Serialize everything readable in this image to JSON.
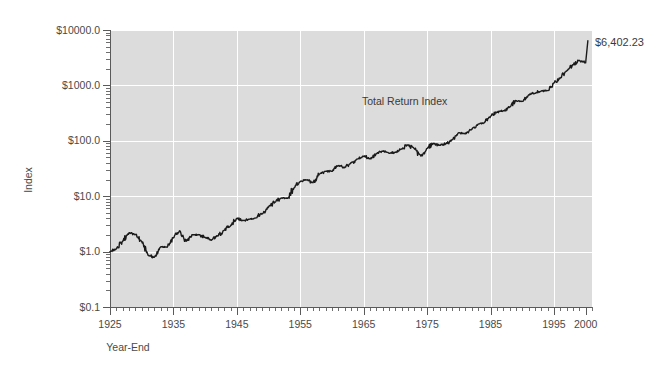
{
  "chart_data": {
    "type": "line",
    "title": "",
    "subtitle": "",
    "xlabel": "Year-End",
    "ylabel": "Index",
    "yscale": "log",
    "ylim": [
      0.1,
      10000.0
    ],
    "xlim": [
      1925,
      2001
    ],
    "grid": true,
    "legend": "none",
    "series_annotation": "Total Return Index",
    "end_value_label": "$6,402.23",
    "end_value": 6402.23,
    "ytick_labels": [
      "$10000.0",
      "$1000.0",
      "$100.0",
      "$10.0",
      "$1.0",
      "$0.1"
    ],
    "ytick_values": [
      10000.0,
      1000.0,
      100.0,
      10.0,
      1.0,
      0.1
    ],
    "xtick_labels": [
      "1925",
      "1935",
      "1945",
      "1955",
      "1965",
      "1975",
      "1985",
      "1995",
      "2000"
    ],
    "xtick_values": [
      1925,
      1935,
      1945,
      1955,
      1965,
      1975,
      1985,
      1995,
      2000
    ],
    "colors": {
      "plot_background": "#dcdcdc",
      "gridline": "#ffffff",
      "line": "#1a1a1a",
      "text": "#4a4a4a",
      "page_background": "#ffffff"
    },
    "series": [
      {
        "name": "Total Return Index",
        "x": [
          1925,
          1926,
          1927,
          1928,
          1929,
          1930,
          1931,
          1932,
          1933,
          1934,
          1935,
          1936,
          1937,
          1938,
          1939,
          1940,
          1941,
          1942,
          1943,
          1944,
          1945,
          1946,
          1947,
          1948,
          1949,
          1950,
          1951,
          1952,
          1953,
          1954,
          1955,
          1956,
          1957,
          1958,
          1959,
          1960,
          1961,
          1962,
          1963,
          1964,
          1965,
          1966,
          1967,
          1968,
          1969,
          1970,
          1971,
          1972,
          1973,
          1974,
          1975,
          1976,
          1977,
          1978,
          1979,
          1980,
          1981,
          1982,
          1983,
          1984,
          1985,
          1986,
          1987,
          1988,
          1989,
          1990,
          1991,
          1992,
          1993,
          1994,
          1995,
          1996,
          1997,
          1998,
          1999,
          2000
        ],
        "y": [
          1.0,
          1.12,
          1.54,
          2.2,
          2.02,
          1.52,
          0.86,
          0.79,
          1.22,
          1.2,
          1.78,
          2.38,
          1.54,
          2.02,
          2.01,
          1.81,
          1.6,
          1.93,
          2.43,
          2.91,
          3.97,
          3.65,
          3.85,
          4.06,
          4.83,
          6.36,
          7.89,
          9.26,
          9.17,
          13.99,
          18.41,
          19.62,
          17.51,
          25.12,
          28.13,
          28.26,
          35.87,
          32.73,
          40.2,
          46.83,
          52.67,
          47.38,
          58.73,
          65.25,
          59.74,
          62.11,
          70.98,
          84.45,
          72.06,
          52.97,
          72.73,
          90.04,
          83.55,
          89.03,
          105.44,
          139.68,
          132.84,
          161.4,
          197.87,
          210.3,
          277.11,
          328.78,
          346.02,
          403.5,
          531.15,
          514.66,
          671.32,
          722.38,
          794.8,
          805.22,
          1107.5,
          1361.5,
          1815.8,
          2334.2,
          2824.0,
          2566.0
        ]
      }
    ]
  },
  "axis_titles": {
    "x": "Year-End",
    "y": "Index"
  },
  "annotations": {
    "series_label": "Total Return Index",
    "end_value": "$6,402.23"
  },
  "ticks": {
    "y": [
      {
        "label": "$10000.0",
        "value": 10000.0
      },
      {
        "label": "$1000.0",
        "value": 1000.0
      },
      {
        "label": "$100.0",
        "value": 100.0
      },
      {
        "label": "$10.0",
        "value": 10.0
      },
      {
        "label": "$1.0",
        "value": 1.0
      },
      {
        "label": "$0.1",
        "value": 0.1
      }
    ],
    "x": [
      {
        "label": "1925",
        "value": 1925
      },
      {
        "label": "1935",
        "value": 1935
      },
      {
        "label": "1945",
        "value": 1945
      },
      {
        "label": "1955",
        "value": 1955
      },
      {
        "label": "1965",
        "value": 1965
      },
      {
        "label": "1975",
        "value": 1975
      },
      {
        "label": "1985",
        "value": 1985
      },
      {
        "label": "1995",
        "value": 1995
      },
      {
        "label": "2000",
        "value": 2000
      }
    ]
  }
}
